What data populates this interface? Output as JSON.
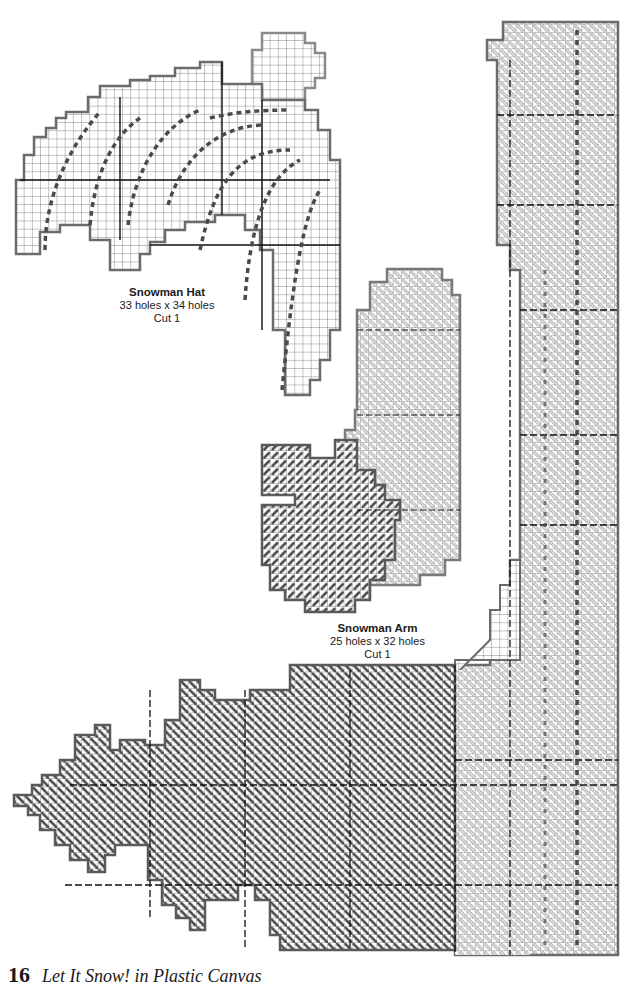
{
  "page": {
    "number": "16",
    "book_title": "Let It Snow! in Plastic Canvas"
  },
  "pieces": [
    {
      "id": "snowman-hat",
      "name": "Snowman Hat",
      "size": "33 holes x 34 holes",
      "cut": "Cut 1"
    },
    {
      "id": "snowman-arm",
      "name": "Snowman Arm",
      "size": "25 holes x 32 holes",
      "cut": "Cut 1"
    },
    {
      "id": "tree-border",
      "name": "",
      "size": "",
      "cut": ""
    }
  ],
  "colors": {
    "paper": "#ffffff",
    "grid_line": "#555555",
    "grid_bold": "#111111",
    "outline": "#6b6b6b",
    "dark_stitch": "#4a4a4a",
    "light_stitch_fill": "#ffffff",
    "light_stitch_edge": "#7a7a7a",
    "text": "#1a1a1a"
  }
}
